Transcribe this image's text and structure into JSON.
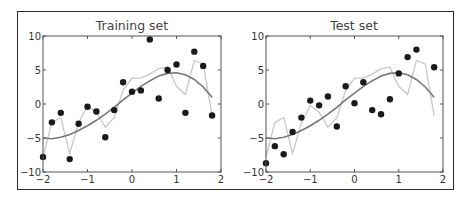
{
  "figure": {
    "border_color": "#2a2a2a",
    "point_color": "#1a1a1a",
    "smooth_color": "#777777",
    "jagged_color": "#c8c8c8"
  },
  "chart_data": [
    {
      "type": "scatter",
      "title": "Training set",
      "xlabel": "",
      "ylabel": "",
      "xlim": [
        -2,
        2
      ],
      "ylim": [
        -10,
        10
      ],
      "xticks": [
        "-2",
        "-1",
        "0",
        "1",
        "2"
      ],
      "yticks": [
        "10",
        "5",
        "0",
        "-5",
        "-10"
      ],
      "grid": false,
      "legend": null,
      "series": [
        {
          "name": "data points",
          "kind": "scatter",
          "x": [
            -2.0,
            -1.8,
            -1.6,
            -1.4,
            -1.2,
            -1.0,
            -0.8,
            -0.6,
            -0.4,
            -0.2,
            0.0,
            0.2,
            0.4,
            0.6,
            0.8,
            1.0,
            1.2,
            1.4,
            1.6,
            1.8
          ],
          "y": [
            -7.8,
            -2.7,
            -1.3,
            -8.1,
            -2.9,
            -0.4,
            -1.1,
            -4.9,
            -0.9,
            3.2,
            1.8,
            2.0,
            9.5,
            0.8,
            5.0,
            5.8,
            -1.3,
            7.7,
            5.6,
            -1.7
          ]
        },
        {
          "name": "low-degree fit",
          "kind": "line",
          "x": [
            -2.0,
            -1.8,
            -1.6,
            -1.4,
            -1.2,
            -1.0,
            -0.8,
            -0.6,
            -0.4,
            -0.2,
            0.0,
            0.2,
            0.4,
            0.6,
            0.8,
            1.0,
            1.2,
            1.4,
            1.6,
            1.8
          ],
          "y": [
            -5.0,
            -5.1,
            -4.9,
            -4.5,
            -3.9,
            -3.2,
            -2.4,
            -1.5,
            -0.5,
            0.6,
            1.6,
            2.6,
            3.4,
            4.1,
            4.5,
            4.6,
            4.3,
            3.6,
            2.5,
            1.0
          ]
        },
        {
          "name": "high-degree fit",
          "kind": "line",
          "x": [
            -2.0,
            -1.8,
            -1.6,
            -1.4,
            -1.2,
            -1.0,
            -0.8,
            -0.6,
            -0.4,
            -0.2,
            0.0,
            0.2,
            0.4,
            0.6,
            0.8,
            1.0,
            1.2,
            1.4,
            1.6,
            1.8
          ],
          "y": [
            -7.8,
            -2.7,
            -2.0,
            -7.3,
            -2.8,
            -0.2,
            -1.2,
            -3.4,
            -2.0,
            2.0,
            3.8,
            3.8,
            4.4,
            5.2,
            5.4,
            2.6,
            1.4,
            6.4,
            5.9,
            -1.7
          ]
        }
      ]
    },
    {
      "type": "scatter",
      "title": "Test set",
      "xlabel": "",
      "ylabel": "",
      "xlim": [
        -2,
        2
      ],
      "ylim": [
        -10,
        10
      ],
      "xticks": [
        "-2",
        "-1",
        "0",
        "1",
        "2"
      ],
      "yticks": [
        "10",
        "5",
        "0",
        "-5",
        "-10"
      ],
      "grid": false,
      "legend": null,
      "series": [
        {
          "name": "data points",
          "kind": "scatter",
          "x": [
            -2.0,
            -1.8,
            -1.6,
            -1.4,
            -1.2,
            -1.0,
            -0.8,
            -0.6,
            -0.4,
            -0.2,
            0.0,
            0.2,
            0.4,
            0.6,
            0.8,
            1.0,
            1.2,
            1.4,
            1.8
          ],
          "y": [
            -8.7,
            -6.2,
            -7.4,
            -4.1,
            -2.0,
            0.5,
            -0.2,
            1.1,
            -3.3,
            2.6,
            0.1,
            3.2,
            -0.9,
            -1.5,
            0.7,
            4.5,
            6.9,
            8.0,
            5.4
          ]
        },
        {
          "name": "low-degree fit",
          "kind": "line",
          "x": [
            -2.0,
            -1.8,
            -1.6,
            -1.4,
            -1.2,
            -1.0,
            -0.8,
            -0.6,
            -0.4,
            -0.2,
            0.0,
            0.2,
            0.4,
            0.6,
            0.8,
            1.0,
            1.2,
            1.4,
            1.6,
            1.8
          ],
          "y": [
            -5.0,
            -5.1,
            -4.9,
            -4.5,
            -3.9,
            -3.2,
            -2.4,
            -1.5,
            -0.5,
            0.6,
            1.6,
            2.6,
            3.4,
            4.1,
            4.5,
            4.6,
            4.3,
            3.6,
            2.5,
            1.0
          ]
        },
        {
          "name": "high-degree fit",
          "kind": "line",
          "x": [
            -2.0,
            -1.8,
            -1.6,
            -1.4,
            -1.2,
            -1.0,
            -0.8,
            -0.6,
            -0.4,
            -0.2,
            0.0,
            0.2,
            0.4,
            0.6,
            0.8,
            1.0,
            1.2,
            1.4,
            1.6,
            1.8
          ],
          "y": [
            -7.8,
            -2.7,
            -2.0,
            -7.3,
            -2.8,
            -0.2,
            -1.2,
            -3.4,
            -2.0,
            2.0,
            3.8,
            3.8,
            4.4,
            5.2,
            5.4,
            2.6,
            1.4,
            6.4,
            5.9,
            -1.7
          ]
        }
      ]
    }
  ]
}
